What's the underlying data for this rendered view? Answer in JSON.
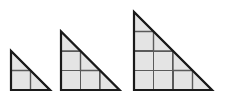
{
  "figure": {
    "name": "triangular-grid-sequence",
    "background_color": "#ffffff",
    "canvas": {
      "width": 229,
      "height": 102
    },
    "style": {
      "cell_fill": "#e4e4e4",
      "grid_line_color": "#5a5a5a",
      "outline_color": "#1a1a1a",
      "grid_line_width": 1.4,
      "outline_width": 2.2,
      "cell_size": 19.5,
      "baseline_y": 90
    },
    "shapes": [
      {
        "name": "triangle-1",
        "label": "",
        "order": 1,
        "grid_n": 2,
        "unit_squares": 1,
        "half_squares": 2,
        "total_shaded_units": 2,
        "origin_x": 11,
        "origin_y": 90,
        "legs": {
          "base": 39,
          "height": 39
        }
      },
      {
        "name": "triangle-2",
        "label": "",
        "order": 2,
        "grid_n": 3,
        "unit_squares": 3,
        "half_squares": 3,
        "total_shaded_units": 4.5,
        "origin_x": 61,
        "origin_y": 90,
        "legs": {
          "base": 58.5,
          "height": 58.5
        }
      },
      {
        "name": "triangle-3",
        "label": "",
        "order": 3,
        "grid_n": 4,
        "unit_squares": 6,
        "half_squares": 4,
        "total_shaded_units": 8,
        "origin_x": 134,
        "origin_y": 90,
        "legs": {
          "base": 78,
          "height": 78
        }
      }
    ]
  }
}
